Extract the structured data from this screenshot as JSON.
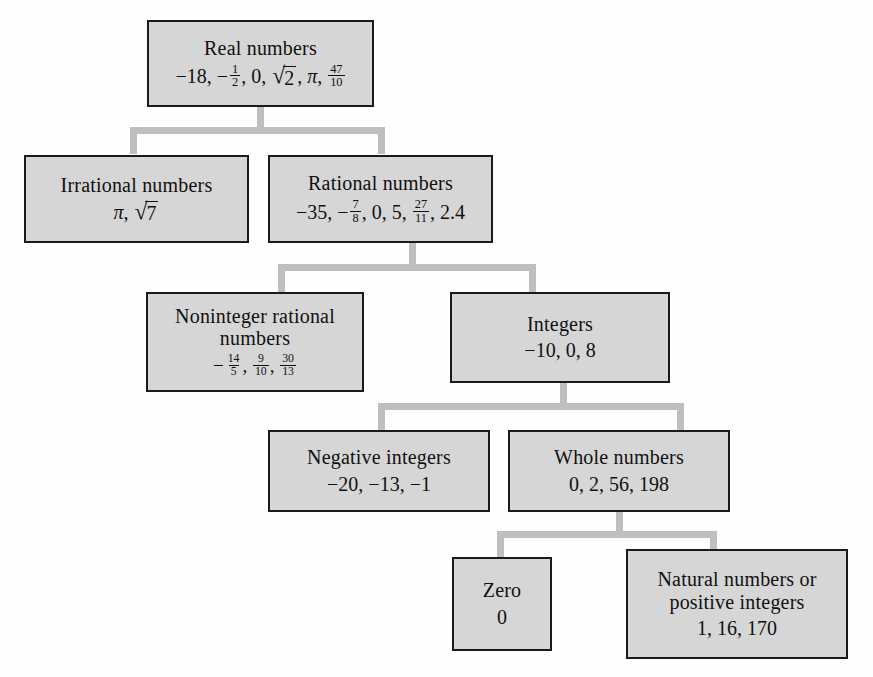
{
  "diagram": {
    "type": "tree",
    "colors": {
      "box_fill": "#d6d6d6",
      "box_border": "#1b1b1b",
      "connector": "#bfbfbf",
      "background": "#fefefe",
      "text": "#111111"
    },
    "nodes": [
      {
        "id": "real",
        "label": "Real numbers",
        "examples_text": "−18, − 1/2, 0, √2, π, 47/10",
        "examples": [
          "−18",
          "−1/2",
          "0",
          "√2",
          "π",
          "47/10"
        ],
        "parent": null
      },
      {
        "id": "irrational",
        "label": "Irrational numbers",
        "examples_text": "π, √7",
        "examples": [
          "π",
          "√7"
        ],
        "parent": "real"
      },
      {
        "id": "rational",
        "label": "Rational numbers",
        "examples_text": "−35, − 7/8, 0, 5, 27/11, 2.4",
        "examples": [
          "−35",
          "−7/8",
          "0",
          "5",
          "27/11",
          "2.4"
        ],
        "parent": "real"
      },
      {
        "id": "noninteger",
        "label": "Noninteger rational\nnumbers",
        "examples_text": "− 14/5, 9/10, 30/13",
        "examples": [
          "−14/5",
          "9/10",
          "30/13"
        ],
        "parent": "rational"
      },
      {
        "id": "integers",
        "label": "Integers",
        "examples_text": "−10, 0, 8",
        "examples": [
          "−10",
          "0",
          "8"
        ],
        "parent": "rational"
      },
      {
        "id": "negative",
        "label": "Negative integers",
        "examples_text": "−20, −13, −1",
        "examples": [
          "−20",
          "−13",
          "−1"
        ],
        "parent": "integers"
      },
      {
        "id": "whole",
        "label": "Whole numbers",
        "examples_text": "0, 2, 56, 198",
        "examples": [
          "0",
          "2",
          "56",
          "198"
        ],
        "parent": "integers"
      },
      {
        "id": "zero",
        "label": "Zero",
        "examples_text": "0",
        "examples": [
          "0"
        ],
        "parent": "whole"
      },
      {
        "id": "natural",
        "label": "Natural numbers or\npositive integers",
        "examples_text": "1, 16, 170",
        "examples": [
          "1",
          "16",
          "170"
        ],
        "parent": "whole"
      }
    ]
  }
}
